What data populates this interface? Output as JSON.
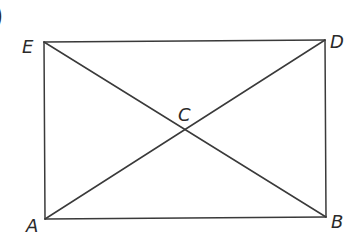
{
  "figure": {
    "prefix_glyph": ")",
    "shape": "rectangle with diagonals",
    "points": {
      "E": {
        "label": "E",
        "x": 44,
        "y": 42
      },
      "D": {
        "label": "D",
        "x": 325,
        "y": 40
      },
      "A": {
        "label": "A",
        "x": 45,
        "y": 219
      },
      "B": {
        "label": "B",
        "x": 326,
        "y": 217
      },
      "C": {
        "label": "C",
        "x": 184,
        "y": 129
      }
    },
    "segments": [
      "ED",
      "EA",
      "DB",
      "AB",
      "EB",
      "AD"
    ],
    "stroke_color": "#3a3a3a"
  }
}
